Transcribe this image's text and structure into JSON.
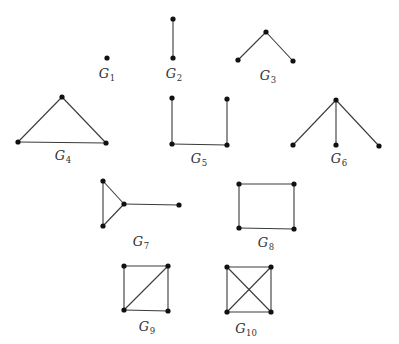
{
  "diagram": {
    "title": "",
    "node_radius": 2.6,
    "colors": {
      "edge": "#3a3a3a",
      "node": "#111111",
      "label": "#333333",
      "background": "#ffffff"
    },
    "graphs": [
      {
        "id": "G1",
        "label": {
          "letter": "G",
          "sub": "1",
          "x": 107,
          "y": 73
        },
        "nodes": [
          [
            107,
            58
          ]
        ],
        "edges": []
      },
      {
        "id": "G2",
        "label": {
          "letter": "G",
          "sub": "2",
          "x": 174,
          "y": 73
        },
        "nodes": [
          [
            173,
            19
          ],
          [
            173,
            58
          ]
        ],
        "edges": [
          [
            0,
            1
          ]
        ]
      },
      {
        "id": "G3",
        "label": {
          "letter": "G",
          "sub": "3",
          "x": 268,
          "y": 75
        },
        "nodes": [
          [
            266,
            32
          ],
          [
            238,
            60
          ],
          [
            293,
            61
          ]
        ],
        "edges": [
          [
            0,
            1
          ],
          [
            0,
            2
          ]
        ]
      },
      {
        "id": "G4",
        "label": {
          "letter": "G",
          "sub": "4",
          "x": 63,
          "y": 155
        },
        "nodes": [
          [
            62,
            97
          ],
          [
            18,
            142
          ],
          [
            106,
            143
          ]
        ],
        "edges": [
          [
            0,
            1
          ],
          [
            0,
            2
          ],
          [
            1,
            2
          ]
        ]
      },
      {
        "id": "G5",
        "label": {
          "letter": "G",
          "sub": "5",
          "x": 199,
          "y": 158
        },
        "nodes": [
          [
            172,
            98
          ],
          [
            227,
            99
          ],
          [
            172,
            144
          ],
          [
            227,
            145
          ]
        ],
        "edges": [
          [
            0,
            2
          ],
          [
            1,
            3
          ],
          [
            2,
            3
          ]
        ]
      },
      {
        "id": "G6",
        "label": {
          "letter": "G",
          "sub": "6",
          "x": 339,
          "y": 158
        },
        "nodes": [
          [
            336,
            100
          ],
          [
            293,
            145
          ],
          [
            336,
            145
          ],
          [
            379,
            146
          ]
        ],
        "edges": [
          [
            0,
            1
          ],
          [
            0,
            2
          ],
          [
            0,
            3
          ]
        ]
      },
      {
        "id": "G7",
        "label": {
          "letter": "G",
          "sub": "7",
          "x": 141,
          "y": 241
        },
        "nodes": [
          [
            103,
            181
          ],
          [
            103,
            226
          ],
          [
            124,
            204
          ],
          [
            179,
            205
          ]
        ],
        "edges": [
          [
            0,
            1
          ],
          [
            0,
            2
          ],
          [
            1,
            2
          ],
          [
            2,
            3
          ]
        ]
      },
      {
        "id": "G8",
        "label": {
          "letter": "G",
          "sub": "8",
          "x": 266,
          "y": 242
        },
        "nodes": [
          [
            239,
            184
          ],
          [
            294,
            184
          ],
          [
            239,
            228
          ],
          [
            294,
            229
          ]
        ],
        "edges": [
          [
            0,
            1
          ],
          [
            0,
            2
          ],
          [
            1,
            3
          ],
          [
            2,
            3
          ]
        ]
      },
      {
        "id": "G9",
        "label": {
          "letter": "G",
          "sub": "9",
          "x": 147,
          "y": 326
        },
        "nodes": [
          [
            124,
            266
          ],
          [
            168,
            266
          ],
          [
            124,
            310
          ],
          [
            168,
            311
          ]
        ],
        "edges": [
          [
            0,
            1
          ],
          [
            0,
            2
          ],
          [
            1,
            3
          ],
          [
            2,
            3
          ],
          [
            2,
            1
          ]
        ]
      },
      {
        "id": "G10",
        "label": {
          "letter": "G",
          "sub": "10",
          "x": 246,
          "y": 328
        },
        "nodes": [
          [
            227,
            267
          ],
          [
            271,
            267
          ],
          [
            227,
            312
          ],
          [
            271,
            312
          ]
        ],
        "edges": [
          [
            0,
            1
          ],
          [
            0,
            2
          ],
          [
            1,
            3
          ],
          [
            2,
            3
          ],
          [
            0,
            3
          ],
          [
            1,
            2
          ]
        ]
      }
    ]
  }
}
